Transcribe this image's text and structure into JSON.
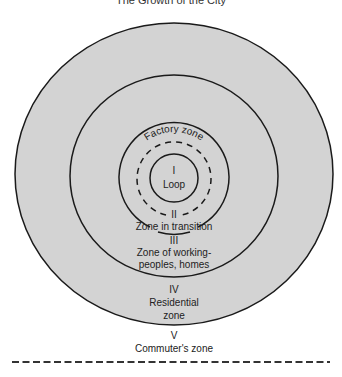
{
  "title": "The Growth of the City",
  "colors": {
    "background": "#ffffff",
    "zone_fill": "#d3d3d3",
    "stroke": "#1a1a1a",
    "text": "#222222"
  },
  "zones": [
    {
      "numeral": "I",
      "name": "Loop"
    },
    {
      "numeral": "II",
      "name": "Zone in transition",
      "sublabel": "Factory zone"
    },
    {
      "numeral": "III",
      "name_line1": "Zone of working-",
      "name_line2": "peoples, homes"
    },
    {
      "numeral": "IV",
      "name_line1": "Residential",
      "name_line2": "zone"
    },
    {
      "numeral": "V",
      "name": "Commuter's zone"
    }
  ]
}
